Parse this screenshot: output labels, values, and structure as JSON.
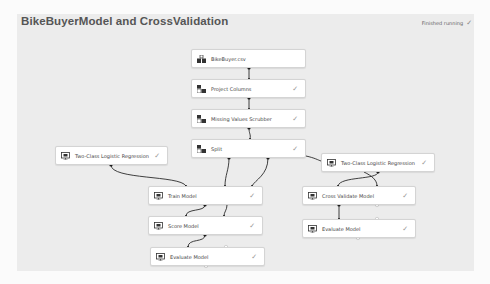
{
  "header": {
    "title": "BikeBuyerModel and CrossValidation",
    "status_text": "Finished running",
    "status_icon": "checkmark-icon"
  },
  "colors": {
    "canvas_bg": "#ececec",
    "node_bg": "#ffffff",
    "node_border": "#d4d4d4",
    "wire": "#333333",
    "text": "#444444",
    "checkmark": "#999999"
  },
  "nodes": [
    {
      "id": "bikebuyer-csv",
      "label": "BikeBuyer.csv",
      "icon": "dataset-icon",
      "completed": false
    },
    {
      "id": "project-columns",
      "label": "Project Columns",
      "icon": "data-transform-icon",
      "completed": true
    },
    {
      "id": "missing-values-scrubber",
      "label": "Missing Values Scrubber",
      "icon": "data-transform-icon",
      "completed": true
    },
    {
      "id": "split",
      "label": "Split",
      "icon": "data-transform-icon",
      "completed": true
    },
    {
      "id": "two-class-lr-left",
      "label": "Two-Class Logistic Regression",
      "icon": "model-icon",
      "completed": true
    },
    {
      "id": "two-class-lr-right",
      "label": "Two-Class Logistic Regression",
      "icon": "model-icon",
      "completed": true
    },
    {
      "id": "train-model",
      "label": "Train Model",
      "icon": "model-icon",
      "completed": true
    },
    {
      "id": "cross-validate-model",
      "label": "Cross Validate Model",
      "icon": "model-icon",
      "completed": true
    },
    {
      "id": "score-model",
      "label": "Score Model",
      "icon": "model-icon",
      "completed": true
    },
    {
      "id": "evaluate-model-right",
      "label": "Evaluate Model",
      "icon": "model-icon",
      "completed": true
    },
    {
      "id": "evaluate-model-left",
      "label": "Evaluate Model",
      "icon": "model-icon",
      "completed": true
    }
  ],
  "check_glyph": "✓"
}
